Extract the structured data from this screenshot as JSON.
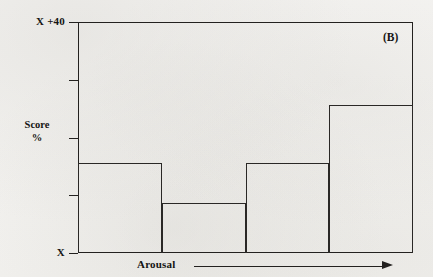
{
  "chart_data": {
    "type": "bar",
    "title": "",
    "panel_label": "(B)",
    "xlabel": "Arousal",
    "ylabel": "Score\n%",
    "ylabel_lines": [
      "Score",
      "%"
    ],
    "categories": [
      "1",
      "2",
      "3",
      "4"
    ],
    "values": [
      15.6,
      8.7,
      15.6,
      25.6
    ],
    "ylim": [
      0,
      40
    ],
    "ytick_values": [
      0,
      10,
      20,
      30,
      40
    ],
    "ytick_labels": [
      "X",
      "",
      "",
      "",
      "X +40"
    ],
    "y_axis_top_label": "X +40",
    "y_axis_bottom_label": "X",
    "grid": false,
    "legend": false,
    "bar_fill": "none",
    "bar_outline_color": "#2a2826",
    "frame_color": "#23211f",
    "background_color": "#f5f4f2",
    "x_axis_arrow": true
  },
  "axis": {
    "top_label": "X +40",
    "bottom_label": "X",
    "score_line1": "Score",
    "score_line2": "%",
    "x_caption": "Arousal"
  },
  "panel": {
    "tag": "(B)"
  },
  "ticks": [
    {
      "name": "tick-40",
      "top": 22
    },
    {
      "name": "tick-30",
      "top": 78
    },
    {
      "name": "tick-20",
      "top": 137
    },
    {
      "name": "tick-10",
      "top": 192
    },
    {
      "name": "tick-0",
      "top": 253
    }
  ],
  "bars": [
    {
      "name": "bar-1",
      "left": 78,
      "width": 84,
      "top": 163,
      "height": 91,
      "value": 15.6
    },
    {
      "name": "bar-2",
      "left": 161,
      "width": 85,
      "top": 203,
      "height": 51,
      "value": 8.7
    },
    {
      "name": "bar-3",
      "left": 245,
      "width": 85,
      "top": 163,
      "height": 91,
      "value": 15.6
    },
    {
      "name": "bar-4",
      "left": 329,
      "width": 85,
      "top": 105,
      "height": 149,
      "value": 25.6
    }
  ]
}
